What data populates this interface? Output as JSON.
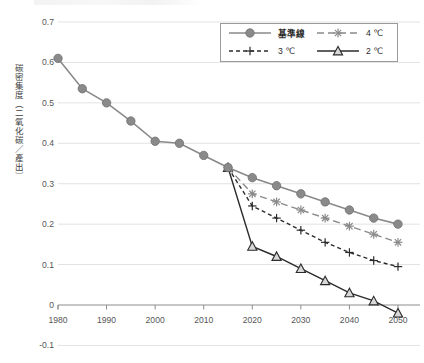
{
  "figure": {
    "axis_color": "#8d8d8d",
    "grid_color": "#e2e2e2",
    "background": "#ffffff"
  },
  "legend": {
    "position": "top-right",
    "entries": [
      {
        "label": "基準線",
        "key": "baseline",
        "color": "#8a8a8a",
        "marker": "circle",
        "dash": "solid"
      },
      {
        "label": "4 ℃",
        "key": "c4",
        "color": "#8a8a8a",
        "marker": "asterisk",
        "dash": "dashed"
      },
      {
        "label": "3 ℃",
        "key": "c3",
        "color": "#2b2b2b",
        "marker": "plus",
        "dash": "dashed"
      },
      {
        "label": "2 ℃",
        "key": "c2",
        "color": "#2b2b2b",
        "marker": "triangle",
        "dash": "solid"
      }
    ]
  },
  "chart_data": {
    "type": "line",
    "title": "",
    "xlabel": "",
    "ylabel": "碳密集度（二氧化碳／產出）",
    "xlim": [
      1980,
      2050
    ],
    "ylim": [
      -0.1,
      0.7
    ],
    "ytick_labels": [
      "0.7",
      "0.6",
      "0.5",
      "0.4",
      "0.3",
      "0.2",
      "0.1",
      "0",
      "-0.1"
    ],
    "ytick_values": [
      0.7,
      0.6,
      0.5,
      0.4,
      0.3,
      0.2,
      0.1,
      0,
      -0.1
    ],
    "xtick_labels": [
      "1980",
      "1990",
      "2000",
      "2010",
      "2020",
      "2030",
      "2040",
      "2050"
    ],
    "xtick_values": [
      1980,
      1990,
      2000,
      2010,
      2020,
      2030,
      2040,
      2050
    ],
    "grid": "horizontal",
    "legend_position": "top-right",
    "series": [
      {
        "name": "基準線",
        "color": "#8a8a8a",
        "marker": "circle",
        "dash": "solid",
        "x": [
          1980,
          1985,
          1990,
          1995,
          2000,
          2005,
          2010,
          2015,
          2020,
          2025,
          2030,
          2035,
          2040,
          2045,
          2050
        ],
        "values": [
          0.61,
          0.535,
          0.5,
          0.455,
          0.405,
          0.4,
          0.37,
          0.34,
          0.315,
          0.295,
          0.275,
          0.255,
          0.235,
          0.215,
          0.2
        ]
      },
      {
        "name": "4 ℃",
        "color": "#8a8a8a",
        "marker": "asterisk",
        "dash": "dashed",
        "x": [
          2015,
          2020,
          2025,
          2030,
          2035,
          2040,
          2045,
          2050
        ],
        "values": [
          0.34,
          0.275,
          0.255,
          0.235,
          0.215,
          0.195,
          0.175,
          0.155
        ]
      },
      {
        "name": "3 ℃",
        "color": "#2b2b2b",
        "marker": "plus",
        "dash": "dashed",
        "x": [
          2015,
          2020,
          2025,
          2030,
          2035,
          2040,
          2045,
          2050
        ],
        "values": [
          0.34,
          0.245,
          0.215,
          0.185,
          0.155,
          0.13,
          0.11,
          0.095
        ]
      },
      {
        "name": "2 ℃",
        "color": "#2b2b2b",
        "marker": "triangle",
        "dash": "solid",
        "x": [
          2015,
          2020,
          2025,
          2030,
          2035,
          2040,
          2045,
          2050
        ],
        "values": [
          0.34,
          0.145,
          0.12,
          0.09,
          0.06,
          0.03,
          0.01,
          -0.02
        ]
      }
    ]
  }
}
